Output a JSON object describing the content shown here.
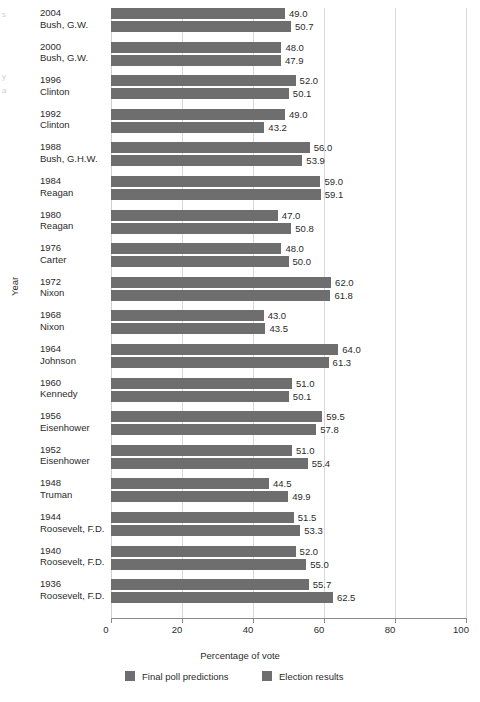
{
  "chart_data": {
    "type": "bar",
    "orientation": "horizontal",
    "title": "",
    "xlabel": "Percentage of vote",
    "ylabel": "Year",
    "xlim": [
      0,
      100
    ],
    "xticks": [
      0,
      20,
      40,
      60,
      80,
      100
    ],
    "grid": true,
    "legend_position": "bottom",
    "value_label_format": "one-decimal",
    "bar_color": "#6e6e6e",
    "categories": [
      "2004\nBush, G.W.",
      "2000\nBush, G.W.",
      "1996\nClinton",
      "1992\nClinton",
      "1988\nBush, G.H.W.",
      "1984\nReagan",
      "1980\nReagan",
      "1976\nCarter",
      "1972\nNixon",
      "1968\nNixon",
      "1964\nJohnson",
      "1960\nKennedy",
      "1956\nEisenhower",
      "1952\nEisenhower",
      "1948\nTruman",
      "1944\nRoosevelt, F.D.",
      "1940\nRoosevelt, F.D.",
      "1936\nRoosevelt, F.D."
    ],
    "series": [
      {
        "name": "Final poll predictions",
        "color": "#6e6e6e",
        "values": [
          49.0,
          48.0,
          52.0,
          49.0,
          56.0,
          59.0,
          47.0,
          48.0,
          62.0,
          43.0,
          64.0,
          51.0,
          59.5,
          51.0,
          44.5,
          51.5,
          52.0,
          55.7
        ]
      },
      {
        "name": "Election results",
        "color": "#6e6e6e",
        "values": [
          50.7,
          47.9,
          50.1,
          43.2,
          53.9,
          59.1,
          50.8,
          50.0,
          61.8,
          43.5,
          61.3,
          50.1,
          57.8,
          55.4,
          49.9,
          53.3,
          55.0,
          62.5
        ]
      }
    ]
  },
  "rows": [
    {
      "year": "2004",
      "person": "Bush, G.W.",
      "poll": "49.0",
      "result": "50.7"
    },
    {
      "year": "2000",
      "person": "Bush, G.W.",
      "poll": "48.0",
      "result": "47.9"
    },
    {
      "year": "1996",
      "person": "Clinton",
      "poll": "52.0",
      "result": "50.1"
    },
    {
      "year": "1992",
      "person": "Clinton",
      "poll": "49.0",
      "result": "43.2"
    },
    {
      "year": "1988",
      "person": "Bush, G.H.W.",
      "poll": "56.0",
      "result": "53.9"
    },
    {
      "year": "1984",
      "person": "Reagan",
      "poll": "59.0",
      "result": "59.1"
    },
    {
      "year": "1980",
      "person": "Reagan",
      "poll": "47.0",
      "result": "50.8"
    },
    {
      "year": "1976",
      "person": "Carter",
      "poll": "48.0",
      "result": "50.0"
    },
    {
      "year": "1972",
      "person": "Nixon",
      "poll": "62.0",
      "result": "61.8"
    },
    {
      "year": "1968",
      "person": "Nixon",
      "poll": "43.0",
      "result": "43.5"
    },
    {
      "year": "1964",
      "person": "Johnson",
      "poll": "64.0",
      "result": "61.3"
    },
    {
      "year": "1960",
      "person": "Kennedy",
      "poll": "51.0",
      "result": "50.1"
    },
    {
      "year": "1956",
      "person": "Eisenhower",
      "poll": "59.5",
      "result": "57.8"
    },
    {
      "year": "1952",
      "person": "Eisenhower",
      "poll": "51.0",
      "result": "55.4"
    },
    {
      "year": "1948",
      "person": "Truman",
      "poll": "44.5",
      "result": "49.9"
    },
    {
      "year": "1944",
      "person": "Roosevelt, F.D.",
      "poll": "51.5",
      "result": "53.3"
    },
    {
      "year": "1940",
      "person": "Roosevelt, F.D.",
      "poll": "52.0",
      "result": "55.0"
    },
    {
      "year": "1936",
      "person": "Roosevelt, F.D.",
      "poll": "55.7",
      "result": "62.5"
    }
  ],
  "axes": {
    "x_title": "Percentage of vote",
    "y_title": "Year",
    "x_ticks": [
      "0",
      "20",
      "40",
      "60",
      "80",
      "100"
    ]
  },
  "legend": {
    "items": [
      {
        "label": "Final poll predictions"
      },
      {
        "label": "Election results"
      }
    ]
  },
  "edge_marks": [
    "s",
    "y",
    "a"
  ]
}
